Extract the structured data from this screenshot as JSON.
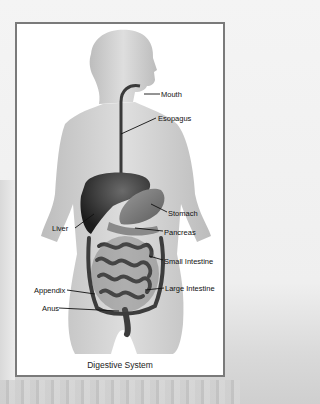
{
  "diagram": {
    "title": "Digestive System",
    "labels": {
      "mouth": "Mouth",
      "esophagus": "Esopagus",
      "stomach": "Stomach",
      "liver": "Liver",
      "pancreas": "Pancreas",
      "small_intestine": "Small Intestine",
      "appendix": "Appendix",
      "large_intestine": "Large Intestine",
      "anus": "Anus"
    },
    "colors": {
      "frame_border": "#7a7a7a",
      "body_skin": "#c9c9c9",
      "organ_dark": "#2a2a2a",
      "background": "#f2f2f2"
    }
  }
}
